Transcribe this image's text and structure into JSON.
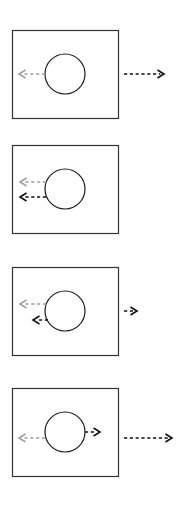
{
  "figure": {
    "title": "Four-panel vector diagram",
    "background_color": "#ffffff",
    "panel_count": 4,
    "colors": {
      "box_stroke": "#333333",
      "circle_stroke": "#1a1a1a",
      "arrow_gray": "#a0a0a0",
      "arrow_black": "#111111"
    },
    "geometry": {
      "canvas_width": 193,
      "canvas_height": 510,
      "box_left": 12,
      "box_width": 106,
      "box_height": 88,
      "circle_cx": 65,
      "circle_r": 20,
      "stroke_width": 1.2
    }
  },
  "panels": [
    {
      "id": "panel-1",
      "label": "Panel 1",
      "top": 30,
      "circle": {
        "cx": 65,
        "cy": 74,
        "r": 20
      },
      "arrows": [
        {
          "name": "inner-gray-left-arrow",
          "color_key": "arrow_gray",
          "direction": "left",
          "dashed": true,
          "x1": 45,
          "y1": 74,
          "x2": 19,
          "y2": 74,
          "location": "inside-box"
        },
        {
          "name": "outer-black-right-arrow",
          "color_key": "arrow_black",
          "direction": "right",
          "dashed": true,
          "x1": 124,
          "y1": 74,
          "x2": 164,
          "y2": 74,
          "location": "outside-box"
        }
      ]
    },
    {
      "id": "panel-2",
      "label": "Panel 2",
      "top": 145,
      "circle": {
        "cx": 65,
        "cy": 189,
        "r": 20
      },
      "arrows": [
        {
          "name": "inner-gray-left-arrow",
          "color_key": "arrow_gray",
          "direction": "left",
          "dashed": true,
          "x1": 46,
          "y1": 182,
          "x2": 20,
          "y2": 182,
          "location": "inside-box"
        },
        {
          "name": "inner-black-left-arrow",
          "color_key": "arrow_black",
          "direction": "left",
          "dashed": true,
          "x1": 46,
          "y1": 197,
          "x2": 20,
          "y2": 197,
          "location": "inside-box"
        }
      ]
    },
    {
      "id": "panel-3",
      "label": "Panel 3",
      "top": 267,
      "circle": {
        "cx": 65,
        "cy": 311,
        "r": 20
      },
      "arrows": [
        {
          "name": "inner-gray-left-arrow",
          "color_key": "arrow_gray",
          "direction": "left",
          "dashed": true,
          "x1": 46,
          "y1": 304,
          "x2": 20,
          "y2": 304,
          "location": "inside-box"
        },
        {
          "name": "inner-black-left-arrow-short",
          "color_key": "arrow_black",
          "direction": "left",
          "dashed": true,
          "x1": 48,
          "y1": 320,
          "x2": 33,
          "y2": 320,
          "location": "inside-box"
        },
        {
          "name": "outer-black-right-arrow-short",
          "color_key": "arrow_black",
          "direction": "right",
          "dashed": true,
          "x1": 124,
          "y1": 311,
          "x2": 137,
          "y2": 311,
          "location": "outside-box"
        }
      ]
    },
    {
      "id": "panel-4",
      "label": "Panel 4",
      "top": 388,
      "circle": {
        "cx": 65,
        "cy": 432,
        "r": 20
      },
      "arrows": [
        {
          "name": "inner-gray-left-arrow",
          "color_key": "arrow_gray",
          "direction": "left",
          "dashed": true,
          "x1": 45,
          "y1": 438,
          "x2": 19,
          "y2": 438,
          "location": "inside-box"
        },
        {
          "name": "inner-black-right-arrow-short",
          "color_key": "arrow_black",
          "direction": "right",
          "dashed": true,
          "x1": 85,
          "y1": 432,
          "x2": 100,
          "y2": 432,
          "location": "inside-box"
        },
        {
          "name": "outer-black-right-arrow",
          "color_key": "arrow_black",
          "direction": "right",
          "dashed": true,
          "x1": 124,
          "y1": 438,
          "x2": 172,
          "y2": 438,
          "location": "outside-box"
        }
      ]
    }
  ]
}
